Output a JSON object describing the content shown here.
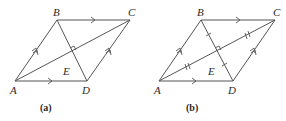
{
  "figures": [
    {
      "id": "a",
      "caption": "(a)",
      "points": {
        "A": {
          "label": "A",
          "x": 15,
          "y": 81
        },
        "B": {
          "label": "B",
          "x": 57,
          "y": 20
        },
        "C": {
          "label": "C",
          "x": 130,
          "y": 20
        },
        "D": {
          "label": "D",
          "x": 87,
          "y": 81
        },
        "E": {
          "label": "E",
          "x": 72,
          "y": 52
        }
      },
      "marks": {
        "parallel_single": [
          "BC",
          "AD"
        ],
        "parallel_double": [
          "AB",
          "DC"
        ],
        "right_angle_at": "E",
        "equal_segments": []
      }
    },
    {
      "id": "b",
      "caption": "(b)",
      "points": {
        "A": {
          "label": "A",
          "x": 159,
          "y": 81
        },
        "B": {
          "label": "B",
          "x": 201,
          "y": 20
        },
        "C": {
          "label": "C",
          "x": 275,
          "y": 20
        },
        "D": {
          "label": "D",
          "x": 233,
          "y": 81
        },
        "E": {
          "label": "E",
          "x": 217,
          "y": 52
        }
      },
      "marks": {
        "parallel_single": [
          "BC",
          "AD"
        ],
        "parallel_double": [
          "AB",
          "DC"
        ],
        "right_angle_at": "E",
        "equal_segments_single_tick": [
          "BE",
          "ED"
        ],
        "equal_segments_double_tick": [
          "AE",
          "EC"
        ]
      }
    }
  ]
}
